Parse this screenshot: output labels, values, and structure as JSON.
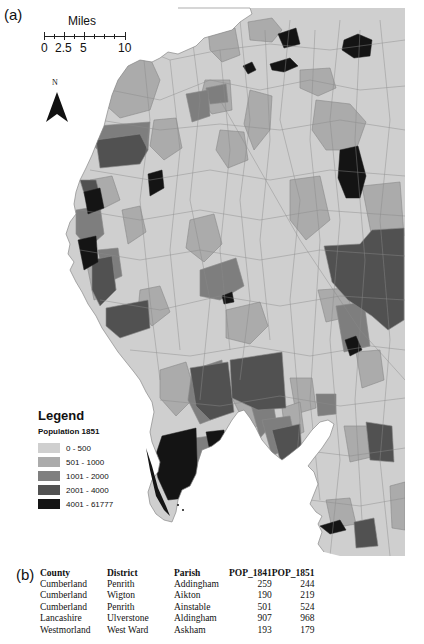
{
  "figure": {
    "panel_a_label": "(a)",
    "panel_b_label": "(b)"
  },
  "scalebar": {
    "title": "Miles",
    "labels": [
      "0",
      "2.5",
      "5",
      "10"
    ]
  },
  "north_arrow": {
    "label": "N"
  },
  "legend": {
    "title": "Legend",
    "subtitle": "Population 1851",
    "classes": [
      {
        "label": "0 - 500",
        "color": "#cfcfcf"
      },
      {
        "label": "501 - 1000",
        "color": "#ababab"
      },
      {
        "label": "1001 - 2000",
        "color": "#7f7f7f"
      },
      {
        "label": "2001 - 4000",
        "color": "#525252"
      },
      {
        "label": "4001 - 61777",
        "color": "#151515"
      }
    ]
  },
  "table": {
    "headers": [
      "County",
      "District",
      "Parish",
      "POP_1841",
      "POP_1851"
    ],
    "rows": [
      [
        "Cumberland",
        "Penrith",
        "Addingham",
        "259",
        "244"
      ],
      [
        "Cumberland",
        "Wigton",
        "Aikton",
        "190",
        "219"
      ],
      [
        "Cumberland",
        "Penrith",
        "Ainstable",
        "501",
        "524"
      ],
      [
        "Lancashire",
        "Ulverstone",
        "Aldingham",
        "907",
        "968"
      ],
      [
        "Westmorland",
        "West Ward",
        "Askham",
        "193",
        "179"
      ]
    ]
  },
  "colors": {
    "water": "#ffffff",
    "boundary": "#8a8a8a",
    "class1": "#cfcfcf",
    "class2": "#ababab",
    "class3": "#7f7f7f",
    "class4": "#525252",
    "class5": "#151515"
  }
}
